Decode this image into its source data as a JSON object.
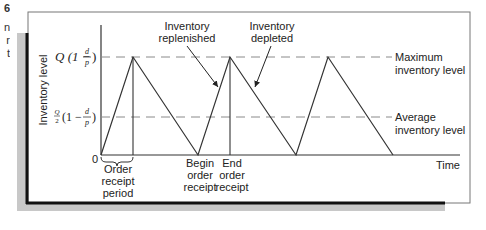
{
  "caption_fragment": [
    "6",
    "n",
    "r",
    "t"
  ],
  "diagram": {
    "y_axis_label": "Inventory level",
    "x_axis_label": "Time",
    "origin_label": "0",
    "levels": {
      "max": {
        "math_main": "Q (1 −",
        "frac_num": "d",
        "frac_den": "p",
        "close": ")",
        "label_line1": "Maximum",
        "label_line2": "inventory level"
      },
      "avg": {
        "math_pre_num": "Q",
        "math_pre_den": "2",
        "math_main": "(1 −",
        "frac_num": "d",
        "frac_den": "p",
        "close": ")",
        "label_line1": "Average",
        "label_line2": "inventory level"
      }
    },
    "annotations": {
      "replenished": [
        "Inventory",
        "replenished"
      ],
      "depleted": [
        "Inventory",
        "depleted"
      ],
      "order_receipt_period": [
        "Order",
        "receipt",
        "period"
      ],
      "begin_order_receipt": [
        "Begin",
        "order",
        "receipt"
      ],
      "end_order_receipt": [
        "End",
        "order",
        "receipt"
      ]
    },
    "colors": {
      "line": "#333333",
      "dash": "#8a8a8a",
      "frame_shadow": "#c8c8c8",
      "frame_black": "#111111"
    }
  }
}
